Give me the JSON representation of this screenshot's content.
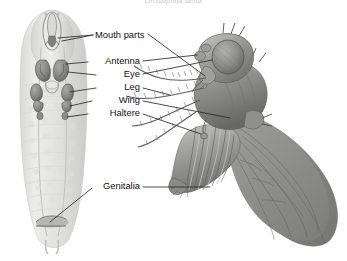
{
  "figure": {
    "title": "Drosophila larva",
    "background_color": "#ffffff",
    "label_color": "#111111",
    "leader_line_color": "#2b2b2b",
    "specimen_ink": "#808080"
  },
  "labels": [
    {
      "id": "mouth-parts",
      "text": "Mouth parts",
      "x": 145,
      "y": 31
    },
    {
      "id": "antenna",
      "text": "Antenna",
      "x": 138,
      "y": 61
    },
    {
      "id": "eye",
      "text": "Eye",
      "x": 138,
      "y": 74
    },
    {
      "id": "leg",
      "text": "Leg",
      "x": 138,
      "y": 87
    },
    {
      "id": "wing",
      "text": "Wing",
      "x": 138,
      "y": 100
    },
    {
      "id": "haltere",
      "text": "Haltere",
      "x": 138,
      "y": 113
    },
    {
      "id": "genitalia",
      "text": "Genitalia",
      "x": 138,
      "y": 186
    }
  ],
  "specimens": [
    {
      "id": "larva",
      "caption": "Drosophila larva",
      "side": "left"
    },
    {
      "id": "adult-fly",
      "caption": "Adult fly",
      "side": "right"
    }
  ]
}
